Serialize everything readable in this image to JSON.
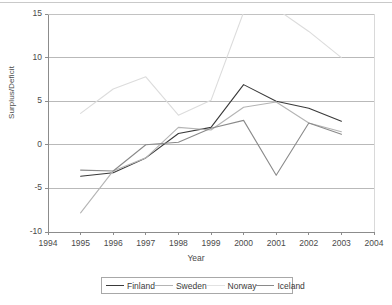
{
  "chart_data": {
    "type": "line",
    "title": "",
    "xlabel": "Year",
    "ylabel": "Surplus/Deficit",
    "grid": true,
    "legend_position": "bottom",
    "xlim": [
      1994,
      2004
    ],
    "ylim": [
      -10,
      15
    ],
    "xticks": [
      "1994",
      "1995",
      "1996",
      "1997",
      "1998",
      "1999",
      "2000",
      "2001",
      "2002",
      "2003",
      "2004"
    ],
    "yticks": [
      "15",
      "10",
      "5",
      "0",
      "-5",
      "-10"
    ],
    "x": [
      1995,
      1996,
      1997,
      1998,
      1999,
      2000,
      2001,
      2002,
      2003
    ],
    "series": [
      {
        "name": "Finland",
        "color": "#3a3a3a",
        "values": [
          -3.6,
          -3.2,
          -1.5,
          1.3,
          2.0,
          6.9,
          5.0,
          4.2,
          2.7
        ]
      },
      {
        "name": "Sweden",
        "color": "#b4b4b4",
        "values": [
          -7.8,
          -3.0,
          -1.5,
          2.0,
          1.7,
          4.3,
          4.9,
          2.5,
          1.5
        ]
      },
      {
        "name": "Norway",
        "color": "#dcdcdc",
        "values": [
          3.6,
          6.4,
          7.8,
          3.4,
          5.1,
          15.2,
          15.6,
          13.0,
          10.0
        ]
      },
      {
        "name": "Iceland",
        "color": "#8a8a8a",
        "values": [
          -2.9,
          -3.0,
          0.0,
          0.3,
          1.9,
          2.8,
          -3.5,
          2.5,
          1.2
        ]
      }
    ]
  },
  "legend": {
    "items": [
      {
        "label": "Finland",
        "color": "#3a3a3a"
      },
      {
        "label": "Sweden",
        "color": "#b4b4b4"
      },
      {
        "label": "Norway",
        "color": "#e2e2e2"
      },
      {
        "label": "Iceland",
        "color": "#8a8a8a"
      }
    ]
  },
  "colors": {
    "axis": "#8c8c8c",
    "grid": "#a8a8a8",
    "text": "#4a4a4a",
    "background": "#ffffff"
  }
}
